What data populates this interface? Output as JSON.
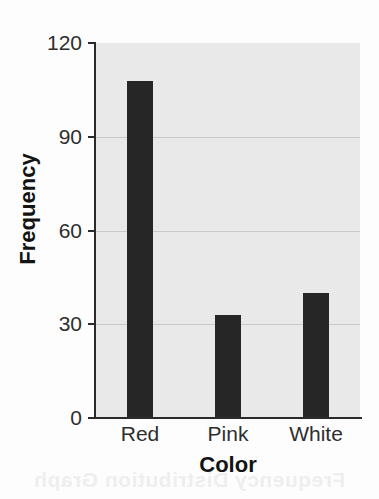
{
  "chart_data": {
    "type": "bar",
    "title": "",
    "categories": [
      "Red",
      "Pink",
      "White"
    ],
    "values": [
      108,
      33,
      40
    ],
    "series": [
      {
        "name": "Frequency",
        "values": [
          108,
          33,
          40
        ]
      }
    ],
    "xlabel": "Color",
    "ylabel": "Frequency",
    "ylim": [
      0,
      120
    ],
    "yticks": [
      0,
      30,
      60,
      90,
      120
    ],
    "ytick_labels": [
      "0",
      "30",
      "60",
      "90",
      "120"
    ],
    "grid": true,
    "grid_axis": "y",
    "legend": false,
    "legend_position": "none",
    "bar_color": "#262626",
    "plot_background": "#e9e9e9",
    "gridline_color": "#c9c9c9",
    "axis_color": "#2b2b2b",
    "figure_background": "#fdfdfd"
  },
  "bleed_through": {
    "top": "",
    "bottom": "Frequency Distribution Graph"
  }
}
